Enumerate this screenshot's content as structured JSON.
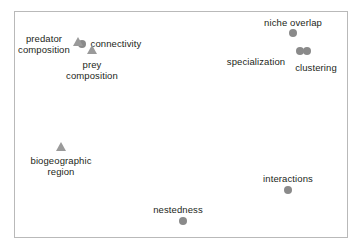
{
  "chart_data": {
    "type": "scatter",
    "title": "",
    "subtitle": "",
    "xlabel": "",
    "ylabel": "",
    "xlim": [
      0,
      100
    ],
    "ylim": [
      0,
      100
    ],
    "grid": false,
    "axis_ticks_visible": false,
    "legend": null,
    "frame": {
      "x": 14,
      "y": 11,
      "width": 334,
      "height": 227,
      "border_color": "#b9b9b9"
    },
    "marker_colors": {
      "circle": "#8a8a8a",
      "triangle": "#9a9a9a"
    },
    "points": [
      {
        "label": "niche overlap",
        "shape": "circle",
        "x": 293,
        "y": 33,
        "size": 8,
        "label_lines": [
          "niche overlap"
        ],
        "label_x": 293,
        "label_y": 17,
        "label_position": "above"
      },
      {
        "label": "specialization",
        "shape": "circle",
        "x": 300,
        "y": 51,
        "size": 8,
        "label_lines": [
          "specialization"
        ],
        "label_x": 256,
        "label_y": 56,
        "label_position": "left"
      },
      {
        "label": "clustering",
        "shape": "circle",
        "x": 307,
        "y": 51,
        "size": 8,
        "label_lines": [
          "clustering"
        ],
        "label_x": 316,
        "label_y": 62,
        "label_position": "below-right"
      },
      {
        "label": "connectivity",
        "shape": "circle",
        "x": 82,
        "y": 44,
        "size": 8,
        "label_lines": [
          "connectivity"
        ],
        "label_x": 116,
        "label_y": 38,
        "label_position": "right"
      },
      {
        "label": "predator composition",
        "shape": "triangle",
        "x": 78,
        "y": 41,
        "size": 9,
        "label_lines": [
          "predator",
          "composition"
        ],
        "label_x": 44,
        "label_y": 33,
        "label_position": "left"
      },
      {
        "label": "prey composition",
        "shape": "triangle",
        "x": 92,
        "y": 49,
        "size": 9,
        "label_lines": [
          "prey",
          "composition"
        ],
        "label_x": 92,
        "label_y": 59,
        "label_position": "below"
      },
      {
        "label": "biogeographic region",
        "shape": "triangle",
        "x": 61,
        "y": 146,
        "size": 9,
        "label_lines": [
          "biogeographic",
          "region"
        ],
        "label_x": 61,
        "label_y": 155,
        "label_position": "below"
      },
      {
        "label": "interactions",
        "shape": "circle",
        "x": 288,
        "y": 190,
        "size": 8,
        "label_lines": [
          "interactions"
        ],
        "label_x": 288,
        "label_y": 173,
        "label_position": "above"
      },
      {
        "label": "nestedness",
        "shape": "circle",
        "x": 183,
        "y": 221,
        "size": 8,
        "label_lines": [
          "nestedness"
        ],
        "label_x": 178,
        "label_y": 204,
        "label_position": "above"
      }
    ]
  }
}
